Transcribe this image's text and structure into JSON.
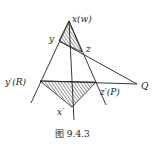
{
  "figure": {
    "caption": "图 9.4.3",
    "labels": {
      "apex": "x(w)",
      "y": "y",
      "z": "z",
      "y_prime": "y′(R)",
      "z_prime": "z′(P)",
      "x_prime": "x′",
      "Q": "Q"
    },
    "points": {
      "apex": [
        69,
        21
      ],
      "y": [
        59,
        41
      ],
      "z": [
        82,
        52
      ],
      "y_prime": [
        40,
        81
      ],
      "z_prime": [
        96,
        82
      ],
      "x_prime": [
        72,
        107
      ],
      "Q": [
        137,
        84
      ]
    },
    "hatched_triangles": [
      "x(w)-y-z",
      "y′(R)-z′(P)-x′"
    ],
    "colors": {
      "line": "#222222",
      "background": "#ffffff"
    }
  }
}
